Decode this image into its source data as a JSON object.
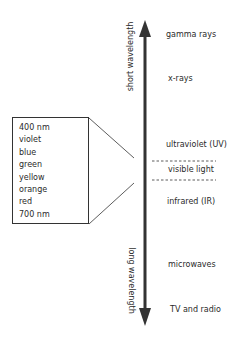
{
  "axis": {
    "top_label": "short wavelength",
    "bottom_label": "long wavelength"
  },
  "spectrum": [
    {
      "name": "gamma rays"
    },
    {
      "name": "x-rays"
    },
    {
      "name": "ultraviolet (UV)"
    },
    {
      "name": "visible light"
    },
    {
      "name": "infrared (IR)"
    },
    {
      "name": "microwaves"
    },
    {
      "name": "TV and radio"
    }
  ],
  "visible_detail": [
    "400 nm",
    "violet",
    "blue",
    "green",
    "yellow",
    "orange",
    "red",
    "700 nm"
  ]
}
